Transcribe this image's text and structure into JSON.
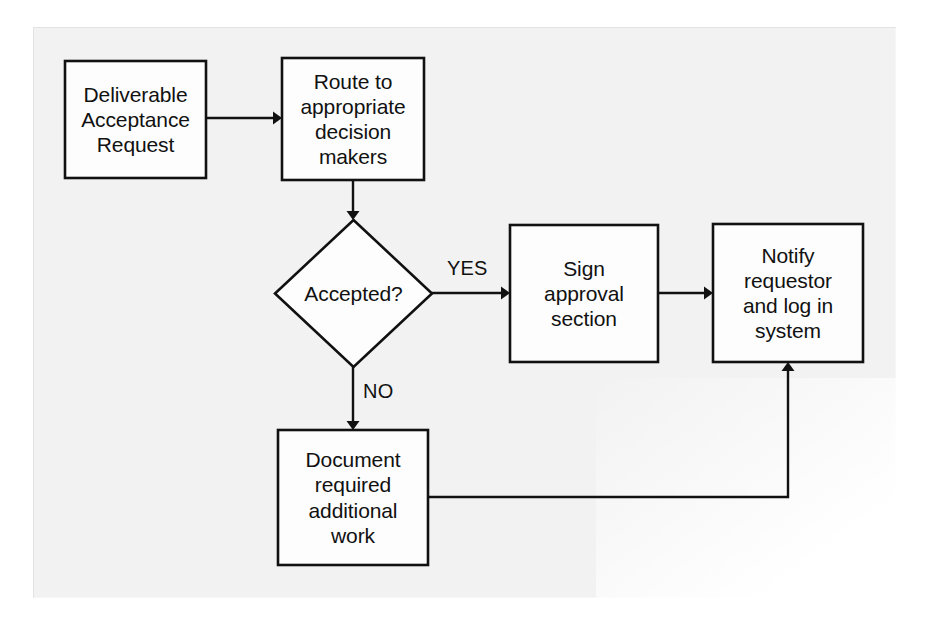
{
  "diagram": {
    "background_color": "#f2f2f2",
    "page_color": "#ffffff",
    "line_color": "#111111",
    "node_fill": "#fdfdfd",
    "nodes": [
      {
        "id": "deliverable-acceptance-request",
        "shape": "process",
        "label": "Deliverable\nAcceptance\nRequest",
        "x": 65,
        "y": 61,
        "w": 141,
        "h": 117
      },
      {
        "id": "route-to-decision-makers",
        "shape": "process",
        "label": "Route to\nappropriate\ndecision\nmakers",
        "x": 282,
        "y": 58,
        "w": 142,
        "h": 122
      },
      {
        "id": "accepted-decision",
        "shape": "decision",
        "label": "Accepted?",
        "x": 275,
        "y": 220,
        "w": 157,
        "h": 147
      },
      {
        "id": "sign-approval-section",
        "shape": "process",
        "label": "Sign\napproval\nsection",
        "x": 510,
        "y": 225,
        "w": 148,
        "h": 137
      },
      {
        "id": "notify-requestor-log",
        "shape": "process",
        "label": "Notify\nrequestor\nand log in\nsystem",
        "x": 713,
        "y": 224,
        "w": 150,
        "h": 138
      },
      {
        "id": "document-additional-work",
        "shape": "process",
        "label": "Document\nrequired\nadditional\nwork",
        "x": 278,
        "y": 430,
        "w": 150,
        "h": 135
      }
    ],
    "edges": [
      {
        "id": "request-to-route",
        "from": "deliverable-acceptance-request",
        "to": "route-to-decision-makers",
        "label": "",
        "path": "M 206 118 L 274 118",
        "arrow": {
          "x": 282,
          "y": 118,
          "dir": "right"
        }
      },
      {
        "id": "route-to-accepted",
        "from": "route-to-decision-makers",
        "to": "accepted-decision",
        "label": "",
        "path": "M 353 180 L 353 212",
        "arrow": {
          "x": 353,
          "y": 220,
          "dir": "down"
        }
      },
      {
        "id": "accepted-yes-to-sign",
        "from": "accepted-decision",
        "to": "sign-approval-section",
        "label": "YES",
        "label_x": 447,
        "label_y": 258,
        "path": "M 432 293 L 502 293",
        "arrow": {
          "x": 510,
          "y": 293,
          "dir": "right"
        }
      },
      {
        "id": "sign-to-notify",
        "from": "sign-approval-section",
        "to": "notify-requestor-log",
        "label": "",
        "path": "M 658 293 L 705 293",
        "arrow": {
          "x": 713,
          "y": 293,
          "dir": "right"
        }
      },
      {
        "id": "accepted-no-to-document",
        "from": "accepted-decision",
        "to": "document-additional-work",
        "label": "NO",
        "label_x": 363,
        "label_y": 381,
        "path": "M 353 367 L 353 422",
        "arrow": {
          "x": 353,
          "y": 430,
          "dir": "down"
        }
      },
      {
        "id": "document-to-notify",
        "from": "document-additional-work",
        "to": "notify-requestor-log",
        "label": "",
        "path": "M 428 497 L 788 497 L 788 370",
        "arrow": {
          "x": 788,
          "y": 362,
          "dir": "up"
        }
      }
    ]
  }
}
